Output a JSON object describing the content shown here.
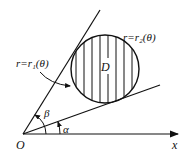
{
  "diagram": {
    "title": "",
    "labels": {
      "origin": "O",
      "x_axis": "x",
      "region": "D",
      "curve_inner": "r=r₁(θ)",
      "curve_outer": "r=r₂(θ)",
      "angle_alpha": "α",
      "angle_beta": "β"
    },
    "colors": {
      "stroke": "#111111",
      "background": "#ffffff"
    },
    "geometry": {
      "origin": [
        23,
        134
      ],
      "x_axis_end": [
        178,
        134
      ],
      "ray_beta_end": [
        100,
        10
      ],
      "ray_alpha_end": [
        160,
        85
      ],
      "circle_center": [
        105,
        69
      ],
      "circle_radius": 34,
      "hatch": "vertical lines"
    }
  }
}
